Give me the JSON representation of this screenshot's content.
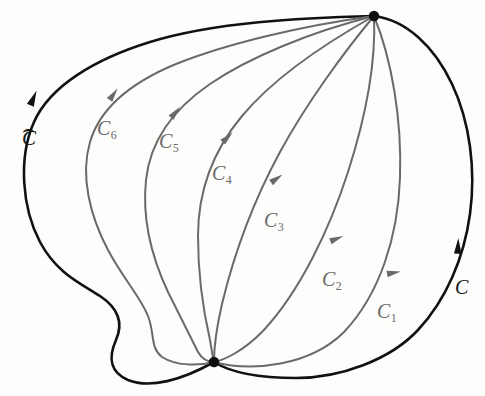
{
  "figure": {
    "type": "math-diagram",
    "background_color": "#fdfdfc",
    "outer_curve_color": "#111111",
    "inner_curve_color": "#6a6a6a",
    "vertices": [
      {
        "name": "top-vertex",
        "x": 374,
        "y": 16
      },
      {
        "name": "bottom-vertex",
        "x": 214,
        "y": 362
      }
    ],
    "labels": [
      {
        "id": "c_hat",
        "base": "C",
        "sub": "",
        "hat": "⌢",
        "color": "#141414",
        "x": 22,
        "y": 128
      },
      {
        "id": "c_6",
        "base": "C",
        "sub": "6",
        "hat": "",
        "color": "#6a6a6a",
        "x": 97,
        "y": 118
      },
      {
        "id": "c_5",
        "base": "C",
        "sub": "5",
        "hat": "",
        "color": "#6a6a6a",
        "x": 159,
        "y": 131
      },
      {
        "id": "c_4",
        "base": "C",
        "sub": "4",
        "hat": "",
        "color": "#6a6a6a",
        "x": 212,
        "y": 163
      },
      {
        "id": "c_3",
        "base": "C",
        "sub": "3",
        "hat": "",
        "color": "#6a6a6a",
        "x": 264,
        "y": 210
      },
      {
        "id": "c_2",
        "base": "C",
        "sub": "2",
        "hat": "",
        "color": "#6a6a6a",
        "x": 322,
        "y": 269
      },
      {
        "id": "c_1",
        "base": "C",
        "sub": "1",
        "hat": "",
        "color": "#6a6a6a",
        "x": 377,
        "y": 301
      },
      {
        "id": "c_outer",
        "base": "C",
        "sub": "",
        "hat": "",
        "color": "#141414",
        "x": 455,
        "y": 277
      }
    ],
    "curves": [
      {
        "id": "c_hat",
        "label": "C-hat",
        "color": "#111111",
        "stroke_width": 2.6,
        "path": "M 374 16 C 300 18 215 22 150 42 C 95 59 50 86 34 122 C 18 158 22 208 40 242 C 57 274 82 284 100 296 C 118 308 124 322 116 340 C 108 358 110 372 128 380 C 150 389 182 380 214 362"
      },
      {
        "id": "c_outer",
        "label": "C",
        "color": "#111111",
        "stroke_width": 2.6,
        "path": "M 374 16 C 406 20 434 46 452 84 C 470 122 476 170 470 214 C 464 258 446 300 418 330 C 390 360 340 378 296 378 C 258 378 230 372 214 362"
      },
      {
        "id": "c_6",
        "label": "C6",
        "color": "#6a6a6a",
        "stroke_width": 2.0,
        "path": "M 374 16 C 300 26 226 44 176 64 C 130 83 100 108 90 142 C 80 176 90 216 108 250 C 124 280 140 296 148 316 C 155 334 150 348 162 357 C 176 366 198 366 214 362"
      },
      {
        "id": "c_5",
        "label": "C5",
        "color": "#6a6a6a",
        "stroke_width": 2.0,
        "path": "M 374 16 C 310 32 248 58 210 84 C 172 110 150 142 146 180 C 142 218 152 258 168 292 C 182 320 192 340 198 352 C 202 359 207 362 214 362"
      },
      {
        "id": "c_4",
        "label": "C4",
        "color": "#6a6a6a",
        "stroke_width": 2.0,
        "path": "M 374 16 C 324 44 272 80 242 116 C 212 152 198 194 198 236 C 198 276 204 314 210 340 C 212 352 213 359 214 362"
      },
      {
        "id": "c_3",
        "label": "C3",
        "color": "#6a6a6a",
        "stroke_width": 2.0,
        "path": "M 374 16 C 344 52 306 104 280 152 C 254 200 234 254 222 304 C 216 330 214 352 214 362"
      },
      {
        "id": "c_2",
        "label": "C2",
        "color": "#6a6a6a",
        "stroke_width": 2.0,
        "path": "M 374 16 C 376 60 366 116 348 172 C 330 228 300 292 262 332 C 242 352 224 360 214 362"
      },
      {
        "id": "c_1",
        "label": "C1",
        "color": "#6a6a6a",
        "stroke_width": 2.0,
        "path": "M 374 16 C 392 60 402 120 400 178 C 398 236 380 294 344 332 C 310 366 252 372 214 362"
      }
    ],
    "arrowheads": [
      {
        "on": "c_hat",
        "x": 33,
        "y": 99,
        "angle": -67,
        "color": "#111111",
        "size": 9
      },
      {
        "on": "c_outer",
        "x": 458,
        "y": 247,
        "angle": -88,
        "color": "#111111",
        "size": 9
      },
      {
        "on": "c_6",
        "x": 113,
        "y": 95,
        "angle": -55,
        "color": "#6a6a6a",
        "size": 8
      },
      {
        "on": "c_5",
        "x": 175,
        "y": 113,
        "angle": -50,
        "color": "#6a6a6a",
        "size": 8
      },
      {
        "on": "c_4",
        "x": 227,
        "y": 138,
        "angle": -45,
        "color": "#6a6a6a",
        "size": 8
      },
      {
        "on": "c_3",
        "x": 276,
        "y": 179,
        "angle": -35,
        "color": "#6a6a6a",
        "size": 8
      },
      {
        "on": "c_2",
        "x": 336,
        "y": 239,
        "angle": -22,
        "color": "#6a6a6a",
        "size": 8
      },
      {
        "on": "c_1",
        "x": 393,
        "y": 273,
        "angle": -10,
        "color": "#6a6a6a",
        "size": 8
      }
    ]
  }
}
